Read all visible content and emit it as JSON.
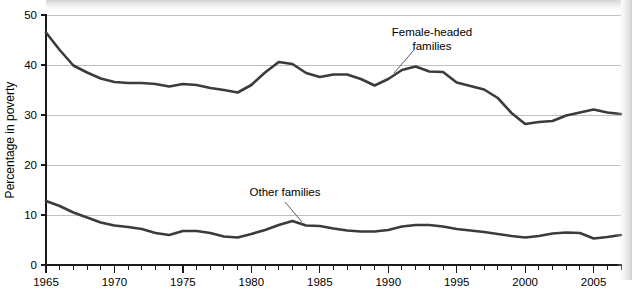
{
  "chart_data": {
    "type": "line",
    "title": "",
    "xlabel": "",
    "ylabel": "Percentage in poverty",
    "xlim": [
      1965,
      2007
    ],
    "ylim": [
      0,
      50
    ],
    "grid": true,
    "legend_position": "inline-annotations",
    "y_ticks": [
      0,
      10,
      20,
      30,
      40,
      50
    ],
    "y_tick_labels": [
      "0",
      "10",
      "20",
      "30",
      "40",
      "50"
    ],
    "x_ticks_major": [
      1965,
      1970,
      1975,
      1980,
      1985,
      1990,
      1995,
      2000,
      2005
    ],
    "x_tick_labels": [
      "1965",
      "1970",
      "1975",
      "1980",
      "1985",
      "1990",
      "1995",
      "2000",
      "2005"
    ],
    "x_minor_tick_step": 1,
    "x": [
      1965,
      1966,
      1967,
      1968,
      1969,
      1970,
      1971,
      1972,
      1973,
      1974,
      1975,
      1976,
      1977,
      1978,
      1979,
      1980,
      1981,
      1982,
      1983,
      1984,
      1985,
      1986,
      1987,
      1988,
      1989,
      1990,
      1991,
      1992,
      1993,
      1994,
      1995,
      1996,
      1997,
      1998,
      1999,
      2000,
      2001,
      2002,
      2003,
      2004,
      2005,
      2006,
      2007
    ],
    "series": [
      {
        "name": "Female-headed families",
        "color": "#3b3b3b",
        "label_anchor_year": 1989,
        "label_anchor_value": 39.0,
        "values": [
          46.5,
          43.0,
          39.9,
          38.5,
          37.3,
          36.6,
          36.4,
          36.4,
          36.2,
          35.7,
          36.2,
          36.0,
          35.4,
          35.0,
          34.5,
          36.0,
          38.5,
          40.6,
          40.2,
          38.4,
          37.6,
          38.1,
          38.1,
          37.2,
          35.9,
          37.2,
          39.0,
          39.7,
          38.7,
          38.6,
          36.5,
          35.8,
          35.1,
          33.4,
          30.4,
          28.2,
          28.6,
          28.8,
          29.9,
          30.5,
          31.1,
          30.5,
          30.2
        ]
      },
      {
        "name": "Other families",
        "color": "#3b3b3b",
        "label_anchor_year": 1983,
        "label_anchor_value": 8.8,
        "values": [
          12.8,
          11.8,
          10.5,
          9.5,
          8.5,
          7.9,
          7.6,
          7.2,
          6.4,
          6.0,
          6.8,
          6.8,
          6.4,
          5.7,
          5.5,
          6.2,
          7.0,
          8.0,
          8.8,
          7.9,
          7.8,
          7.3,
          6.9,
          6.7,
          6.7,
          7.0,
          7.7,
          8.0,
          8.0,
          7.7,
          7.2,
          6.9,
          6.6,
          6.2,
          5.8,
          5.5,
          5.8,
          6.3,
          6.5,
          6.4,
          5.3,
          5.6,
          6.0
        ]
      }
    ],
    "annotations": [
      {
        "text_line1": "Female-headed",
        "text_line2": "families",
        "text_x": 432,
        "text_y": 36,
        "leader_from_x": 414,
        "leader_from_y": 50,
        "leader_to_x": 394,
        "leader_to_y": 73
      },
      {
        "text_line1": "Other families",
        "text_line2": "",
        "text_x": 285,
        "text_y": 196,
        "leader_from_x": 285,
        "leader_from_y": 202,
        "leader_to_x": 302,
        "leader_to_y": 222
      }
    ]
  },
  "layout": {
    "plot_left": 46,
    "plot_right": 621,
    "plot_top": 15,
    "plot_bottom": 265
  }
}
